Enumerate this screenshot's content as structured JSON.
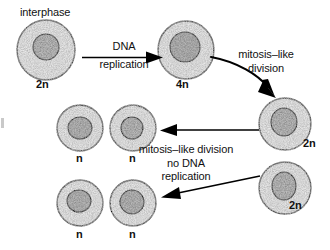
{
  "figure": {
    "type": "biology-cell-division-diagram",
    "background_color": "#ffffff",
    "line_color": "#000000",
    "cytoplasm_fill": "#ededed",
    "nucleus_fill": "#b9b9b9"
  },
  "labels": {
    "interphase": "interphase",
    "dna_replication_line1": "DNA",
    "dna_replication_line2": "replication",
    "mitosis_like_line1": "mitosis–like",
    "mitosis_like_line2": "division",
    "no_replication_line1": "mitosis–like division",
    "no_replication_line2": "no DNA",
    "no_replication_line3": "replication"
  },
  "cells": [
    {
      "id": "cell-interphase",
      "ploidy": "2n",
      "stage_label": "interphase",
      "cx": 46,
      "cy": 50,
      "rx": 29,
      "ry": 30,
      "nucleus_rx": 13,
      "nucleus_ry": 13,
      "nucleus_cx": 46,
      "nucleus_cy": 47
    },
    {
      "id": "cell-replicated",
      "ploidy": "4n",
      "stage_label": "",
      "cx": 186,
      "cy": 50,
      "rx": 28,
      "ry": 29,
      "nucleus_rx": 15,
      "nucleus_ry": 15,
      "nucleus_cx": 185,
      "nucleus_cy": 47
    },
    {
      "id": "cell-daughter-2n-upper",
      "ploidy": "2n",
      "stage_label": "",
      "cx": 285,
      "cy": 124,
      "rx": 26,
      "ry": 26,
      "nucleus_rx": 13,
      "nucleus_ry": 14,
      "nucleus_cx": 284,
      "nucleus_cy": 122
    },
    {
      "id": "cell-daughter-2n-lower",
      "ploidy": "2n",
      "stage_label": "",
      "cx": 285,
      "cy": 188,
      "rx": 26,
      "ry": 26,
      "nucleus_rx": 12,
      "nucleus_ry": 14,
      "nucleus_cx": 284,
      "nucleus_cy": 186
    },
    {
      "id": "cell-haploid-1",
      "ploidy": "n",
      "stage_label": "",
      "cx": 80,
      "cy": 128,
      "rx": 23,
      "ry": 23,
      "nucleus_rx": 12,
      "nucleus_ry": 11,
      "nucleus_cx": 80,
      "nucleus_cy": 128
    },
    {
      "id": "cell-haploid-2",
      "ploidy": "n",
      "stage_label": "",
      "cx": 133,
      "cy": 128,
      "rx": 23,
      "ry": 23,
      "nucleus_rx": 11,
      "nucleus_ry": 11,
      "nucleus_cx": 132,
      "nucleus_cy": 128
    },
    {
      "id": "cell-haploid-3",
      "ploidy": "n",
      "stage_label": "",
      "cx": 80,
      "cy": 203,
      "rx": 23,
      "ry": 23,
      "nucleus_rx": 12,
      "nucleus_ry": 11,
      "nucleus_cx": 79,
      "nucleus_cy": 201
    },
    {
      "id": "cell-haploid-4",
      "ploidy": "n",
      "stage_label": "",
      "cx": 133,
      "cy": 203,
      "rx": 23,
      "ry": 23,
      "nucleus_rx": 12,
      "nucleus_ry": 12,
      "nucleus_cx": 132,
      "nucleus_cy": 202
    }
  ],
  "arrows": [
    {
      "id": "arrow-dna-replication",
      "label": "DNA replication",
      "from_cell": "cell-interphase",
      "to_cell": "cell-replicated",
      "direction": "right",
      "style": "straight"
    },
    {
      "id": "arrow-mitosis-like-division",
      "label": "mitosis–like division",
      "from_cell": "cell-replicated",
      "to_cell": "cell-daughter-2n-upper",
      "direction": "down-right",
      "style": "curved"
    },
    {
      "id": "arrow-division-no-replication-upper",
      "label": "mitosis–like division no DNA replication",
      "from_cell": "cell-daughter-2n-upper",
      "to_cell": "cell-haploid-2",
      "direction": "left",
      "style": "straight"
    },
    {
      "id": "arrow-division-no-replication-lower",
      "label": "mitosis–like division no DNA replication",
      "from_cell": "cell-daughter-2n-lower",
      "to_cell": "cell-haploid-4",
      "direction": "down-left",
      "style": "straight"
    }
  ]
}
